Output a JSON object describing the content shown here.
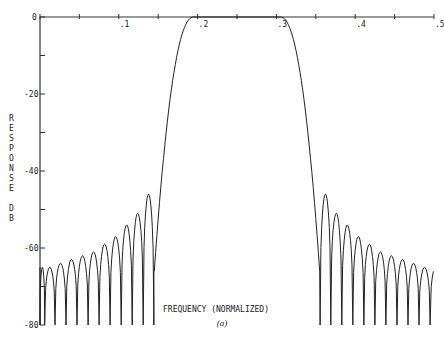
{
  "chart_data": {
    "type": "line",
    "title": "",
    "caption": "(a)",
    "xlabel": "FREQUENCY (NORMALIZED)",
    "ylabel": "RESPONSE DB",
    "xlim": [
      0,
      0.5
    ],
    "ylim": [
      -80,
      0
    ],
    "x_ticks": [
      0,
      0.05,
      0.1,
      0.15,
      0.2,
      0.25,
      0.3,
      0.35,
      0.4,
      0.45,
      0.5
    ],
    "x_tick_labels": [
      "0",
      ".1",
      ".2",
      ".3",
      ".4",
      ".5"
    ],
    "x_tick_label_values": [
      0,
      0.1,
      0.2,
      0.3,
      0.4,
      0.5
    ],
    "y_tick_labels": [
      "0",
      "-20",
      "-40",
      "-60",
      "-80"
    ],
    "y_tick_values": [
      0,
      -20,
      -40,
      -60,
      -80
    ],
    "grid": false,
    "series": [
      {
        "name": "Bandpass filter response",
        "passband": [
          0.19,
          0.31
        ],
        "transition_edges": [
          0.145,
          0.355
        ],
        "stopband_null_db": -80,
        "left_sidelobe_peaks": [
          {
            "f": 0.0,
            "db": -65
          },
          {
            "f": 0.012,
            "db": -65
          },
          {
            "f": 0.026,
            "db": -64
          },
          {
            "f": 0.04,
            "db": -63
          },
          {
            "f": 0.054,
            "db": -62
          },
          {
            "f": 0.068,
            "db": -61
          },
          {
            "f": 0.082,
            "db": -59
          },
          {
            "f": 0.096,
            "db": -57
          },
          {
            "f": 0.11,
            "db": -54
          },
          {
            "f": 0.124,
            "db": -51
          },
          {
            "f": 0.138,
            "db": -46
          }
        ],
        "right_sidelobe_peaks": [
          {
            "f": 0.362,
            "db": -46
          },
          {
            "f": 0.376,
            "db": -51
          },
          {
            "f": 0.39,
            "db": -54
          },
          {
            "f": 0.404,
            "db": -57
          },
          {
            "f": 0.418,
            "db": -59
          },
          {
            "f": 0.432,
            "db": -61
          },
          {
            "f": 0.446,
            "db": -62
          },
          {
            "f": 0.46,
            "db": -63
          },
          {
            "f": 0.474,
            "db": -64
          },
          {
            "f": 0.488,
            "db": -65
          }
        ]
      }
    ]
  }
}
